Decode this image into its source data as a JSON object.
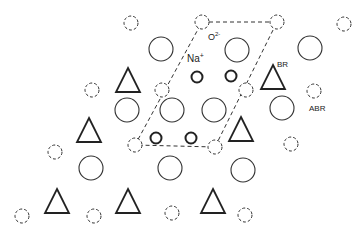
{
  "diagram": {
    "type": "crystal-lattice-schematic",
    "colors": {
      "stroke": "#333333",
      "background": "#ffffff"
    },
    "labels": {
      "oxygen": "O",
      "oxygen_charge": "2-",
      "sodium": "Na",
      "sodium_charge": "+",
      "br": "BR",
      "abr": "ABR"
    },
    "legend_semantics": {
      "dashed_small_circle": "O2- ion",
      "bold_small_circle": "Na+ ion",
      "large_circle": "lattice site",
      "triangle": "BR site",
      "abr_site": "ABR site"
    },
    "unit_cell": {
      "style": "dashed",
      "vertices": [
        [
          202,
          22
        ],
        [
          277,
          22
        ],
        [
          215,
          147
        ],
        [
          135,
          145
        ]
      ]
    },
    "dashed_circles": [
      [
        131,
        23
      ],
      [
        202,
        22
      ],
      [
        277,
        22
      ],
      [
        344,
        24
      ],
      [
        92,
        90
      ],
      [
        162,
        90
      ],
      [
        246,
        90
      ],
      [
        314,
        91
      ],
      [
        135,
        145
      ],
      [
        215,
        147
      ],
      [
        55,
        152
      ],
      [
        291,
        144
      ],
      [
        22,
        216
      ],
      [
        94,
        216
      ],
      [
        172,
        213
      ],
      [
        245,
        215
      ]
    ],
    "large_circles": [
      [
        161,
        49
      ],
      [
        237,
        50
      ],
      [
        310,
        48
      ],
      [
        127,
        110
      ],
      [
        172,
        110
      ],
      [
        214,
        110
      ],
      [
        282,
        108
      ],
      [
        91,
        168
      ],
      [
        170,
        168
      ],
      [
        243,
        170
      ]
    ],
    "bold_small_circles": [
      [
        197,
        77
      ],
      [
        231,
        76
      ],
      [
        156,
        138
      ],
      [
        191,
        138
      ]
    ],
    "triangles": [
      [
        128,
        80
      ],
      [
        273,
        77
      ],
      [
        89,
        130
      ],
      [
        241,
        129
      ],
      [
        57,
        201
      ],
      [
        128,
        201
      ],
      [
        213,
        201
      ]
    ]
  }
}
